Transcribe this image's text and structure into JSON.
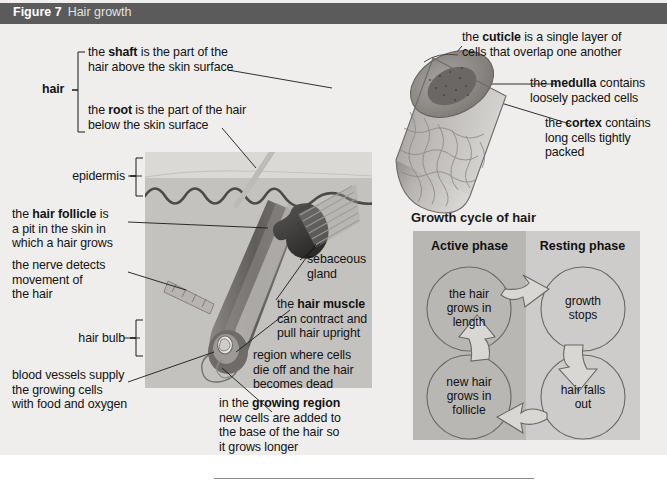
{
  "figure": {
    "number": "Figure 7",
    "title": "Hair growth"
  },
  "colors": {
    "header_bar": "#5b5b5b",
    "page_background": "#efeeec",
    "skin_epidermis": "#d9d8d5",
    "skin_dermis": "#c4c2bf",
    "follicle_dark": "#6e6b68",
    "sebaceous_gland": "#3b3a38",
    "active_phase_panel": "#b9b7b4",
    "resting_phase_panel": "#cecccA",
    "leader_line": "#1a1a1a"
  },
  "skin_diagram": {
    "labels": {
      "hair_bracket": "hair",
      "shaft": {
        "pre": "the ",
        "bold": "shaft",
        "post": " is the part of the\nhair above the skin surface"
      },
      "root": {
        "pre": "the ",
        "bold": "root",
        "post": " is the part of the hair\nbelow the skin surface"
      },
      "epidermis": "epidermis",
      "hair_follicle": {
        "pre": "the ",
        "bold": "hair follicle",
        "post": " is\na pit in the skin in\nwhich a hair grows"
      },
      "nerve": "the nerve detects\nmovement of\nthe hair",
      "hair_bulb": "hair bulb",
      "blood_vessels": "blood vessels supply\nthe growing cells\nwith food and oxygen",
      "sebaceous_gland": "sebaceous\ngland",
      "hair_muscle": {
        "pre": "the ",
        "bold": "hair muscle",
        "post": "\ncan contract and\npull hair upright"
      },
      "dead_region": "region where cells\ndie off and the hair\nbecomes dead",
      "growing_region": {
        "pre": "in the ",
        "bold": "growing region",
        "post": "\nnew cells are added to\nthe base of the hair so\nit grows longer"
      }
    }
  },
  "hair_section": {
    "labels": {
      "cuticle": {
        "pre": "the ",
        "bold": "cuticle",
        "post": " is a single layer of\ncells that overlap one another"
      },
      "medulla": {
        "pre": "the ",
        "bold": "medulla",
        "post": " contains\nloosely packed cells"
      },
      "cortex": {
        "pre": "the ",
        "bold": "cortex",
        "post": " contains\nlong cells tightly\npacked"
      }
    }
  },
  "growth_cycle": {
    "title": "Growth cycle of hair",
    "phases": [
      {
        "name": "Active phase"
      },
      {
        "name": "Resting phase"
      }
    ],
    "stages": [
      {
        "id": "grows-in-length",
        "text": "the hair\ngrows in\nlength",
        "phase": "Active phase"
      },
      {
        "id": "growth-stops",
        "text": "growth\nstops",
        "phase": "Resting phase"
      },
      {
        "id": "hair-falls-out",
        "text": "hair falls\nout",
        "phase": "Resting phase"
      },
      {
        "id": "new-hair",
        "text": "new hair\ngrows in\nfollicle",
        "phase": "Active phase"
      }
    ]
  }
}
